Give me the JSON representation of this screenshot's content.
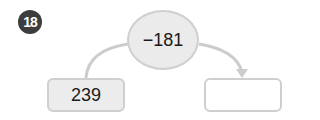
{
  "problem": {
    "number": "18",
    "operation": "−181",
    "input_value": "239",
    "output_value": ""
  },
  "colors": {
    "badge": "#3d3d3d",
    "oval_fill": "#ebebeb",
    "border": "#cfcfcf",
    "arrow": "#cccccc"
  }
}
